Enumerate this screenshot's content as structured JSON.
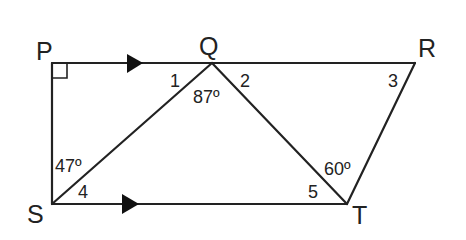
{
  "figure": {
    "type": "geometry-diagram"
  },
  "vertices": {
    "P": "P",
    "Q": "Q",
    "R": "R",
    "S": "S",
    "T": "T"
  },
  "angles": {
    "a1": "1",
    "a2": "2",
    "a3": "3",
    "a4": "4",
    "a5": "5",
    "q_given": "87º",
    "s_given": "47º",
    "t_given": "60º"
  },
  "markers": {
    "right_angle_at": "P",
    "parallel_arrows": [
      "PR",
      "ST"
    ]
  },
  "colors": {
    "line": "#222222",
    "background": "#ffffff"
  }
}
